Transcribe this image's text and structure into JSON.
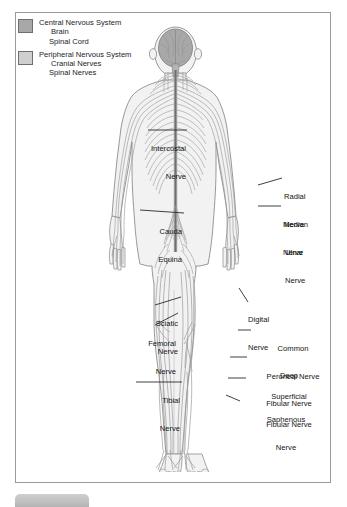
{
  "figure": {
    "frame_border_color": "#9a9a9a",
    "background_color": "#ffffff"
  },
  "legend": {
    "items": [
      {
        "swatch_color": "#a8a8a8",
        "swatch_name": "cns-swatch",
        "heading": "Central Nervous System",
        "sub_items": [
          "Brain",
          "Spinal Cord"
        ]
      },
      {
        "swatch_color": "#cfcfcf",
        "swatch_name": "pns-swatch",
        "heading": "Peripheral Nervous System",
        "sub_items": [
          "Cranial Nerves",
          "Spinal Nerves"
        ]
      }
    ]
  },
  "labels": {
    "left": [
      {
        "id": "intercostal",
        "line1": "Intercostal",
        "line2": "Nerve"
      },
      {
        "id": "cauda",
        "line1": "Cauda",
        "line2": "Equina"
      },
      {
        "id": "sciatic",
        "line1": "Sciatic",
        "line2": "Nerve"
      },
      {
        "id": "femoral",
        "line1": "Femoral",
        "line2": "Nerve"
      },
      {
        "id": "tibial",
        "line1": "Tibial",
        "line2": "Nerve"
      }
    ],
    "right": [
      {
        "id": "radial",
        "line1": "Radial",
        "line2": "Nerve"
      },
      {
        "id": "median",
        "line1": "Median",
        "line2": "Nerve"
      },
      {
        "id": "ulnar",
        "line1": "Ulnar",
        "line2": "Nerve"
      },
      {
        "id": "digital",
        "line1": "Digital",
        "line2": "Nerve"
      },
      {
        "id": "common-peroneal",
        "line1": "Common",
        "line2": "Peroneal Nerve"
      },
      {
        "id": "deep-fibular",
        "line1": "Deep",
        "line2": "Fibular Nerve"
      },
      {
        "id": "superficial-fibular",
        "line1": "Superficial",
        "line2": "Fibular Nerve"
      },
      {
        "id": "saphenous",
        "line1": "Saphenous",
        "line2": "Nerve"
      }
    ]
  },
  "colors": {
    "brain_fill": "#a8a8a8",
    "body_fill": "#f2f2f2",
    "body_outline": "#8d8d8d",
    "nerve_stroke": "#9b9b9b",
    "cord_stroke": "#7a7a7a",
    "leader_line": "#2a2a2a",
    "text": "#141414"
  },
  "watermarks": [
    "",
    ""
  ]
}
